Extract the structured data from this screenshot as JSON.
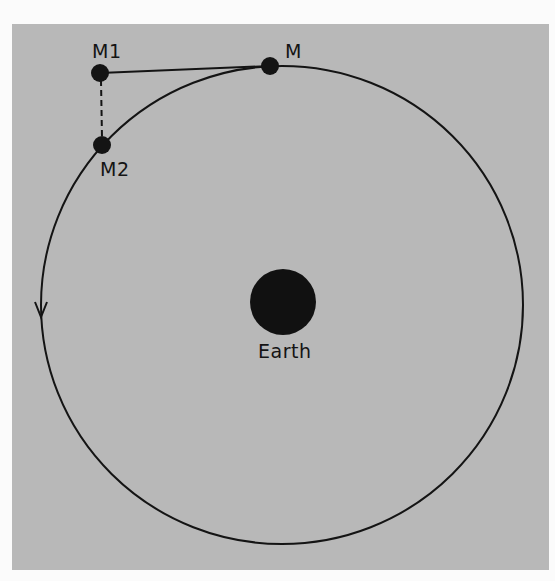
{
  "diagram": {
    "labels": {
      "m1": "M1",
      "m": "M",
      "m2": "M2",
      "earth": "Earth"
    },
    "colors": {
      "background": "#b8b8b8",
      "ink": "#141414",
      "page": "#fbfbfb"
    },
    "orbit": {
      "cx": 282,
      "cy": 305,
      "rx": 241,
      "ry": 239,
      "direction": "counter-clockwise"
    },
    "points": {
      "m": {
        "x": 270,
        "y": 66
      },
      "m1": {
        "x": 100,
        "y": 73
      },
      "m2": {
        "x": 102,
        "y": 145
      },
      "earth": {
        "x": 283,
        "y": 302,
        "r": 33
      }
    }
  }
}
